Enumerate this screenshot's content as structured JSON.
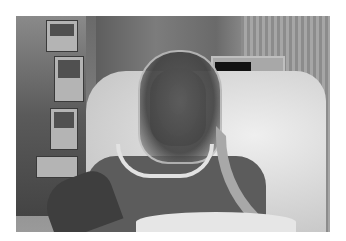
{
  "image": {
    "description": "Grayscale photograph of a patient lying in a hospital bed wearing a clear helmet-style non-invasive ventilation hood, connected to a corrugated breathing tube, with infusion pumps and a monitor in the background",
    "frame": {
      "x": 16,
      "y": 16,
      "width": 314,
      "height": 216
    },
    "background_color": "#ffffff",
    "palette": [
      "#111111",
      "#444444",
      "#5c5c5c",
      "#7a7a7a",
      "#a8a8a8",
      "#d6d6d6",
      "#efefef"
    ]
  }
}
